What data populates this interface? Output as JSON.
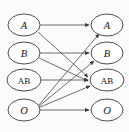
{
  "figure": {
    "background_color": "#fbfbfb",
    "stroke_color": "#3a3a3a",
    "edge_color": "#4a4a4a",
    "label_color": "#141414",
    "width": 129,
    "height": 132
  },
  "left_column": {
    "name": "source-nodes",
    "nodes": [
      {
        "id": "L_A",
        "label": "A",
        "style": "italic",
        "cx": 24,
        "cy": 25,
        "rx": 16,
        "ry": 11
      },
      {
        "id": "L_B",
        "label": "B",
        "style": "italic",
        "cx": 24,
        "cy": 53,
        "rx": 16,
        "ry": 11
      },
      {
        "id": "L_AB",
        "label": "AB",
        "style": "upright",
        "cx": 24,
        "cy": 80,
        "rx": 17,
        "ry": 11
      },
      {
        "id": "L_O",
        "label": "O",
        "style": "italic",
        "cx": 24,
        "cy": 110,
        "rx": 16,
        "ry": 11
      }
    ]
  },
  "right_column": {
    "name": "target-nodes",
    "nodes": [
      {
        "id": "R_A",
        "label": "A",
        "style": "italic",
        "cx": 107,
        "cy": 25,
        "rx": 16,
        "ry": 11
      },
      {
        "id": "R_B",
        "label": "B",
        "style": "italic",
        "cx": 107,
        "cy": 53,
        "rx": 16,
        "ry": 11
      },
      {
        "id": "R_AB",
        "label": "AB",
        "style": "upright",
        "cx": 107,
        "cy": 80,
        "rx": 17,
        "ry": 11
      },
      {
        "id": "R_O",
        "label": "O",
        "style": "italic",
        "cx": 107,
        "cy": 110,
        "rx": 16,
        "ry": 11
      }
    ]
  },
  "edges": [
    {
      "id": "e-A-A",
      "from": "L_A",
      "to": "R_A",
      "from_label": "A",
      "to_label": "A",
      "x1": 40,
      "y1": 25,
      "x2": 89,
      "y2": 25
    },
    {
      "id": "e-A-AB",
      "from": "L_A",
      "to": "R_AB",
      "from_label": "A",
      "to_label": "AB",
      "x1": 38,
      "y1": 32,
      "x2": 88,
      "y2": 77
    },
    {
      "id": "e-B-B",
      "from": "L_B",
      "to": "R_B",
      "from_label": "B",
      "to_label": "B",
      "x1": 40,
      "y1": 53,
      "x2": 89,
      "y2": 53
    },
    {
      "id": "e-B-AB",
      "from": "L_B",
      "to": "R_AB",
      "from_label": "B",
      "to_label": "AB",
      "x1": 39,
      "y1": 58,
      "x2": 88,
      "y2": 81
    },
    {
      "id": "e-AB-AB",
      "from": "L_AB",
      "to": "R_AB",
      "from_label": "AB",
      "to_label": "AB",
      "x1": 41,
      "y1": 80,
      "x2": 88,
      "y2": 80
    },
    {
      "id": "e-O-A",
      "from": "L_O",
      "to": "R_A",
      "from_label": "O",
      "to_label": "A",
      "x1": 38,
      "y1": 106,
      "x2": 99,
      "y2": 34
    },
    {
      "id": "e-O-B",
      "from": "L_O",
      "to": "R_B",
      "from_label": "O",
      "to_label": "B",
      "x1": 38,
      "y1": 107,
      "x2": 94,
      "y2": 61
    },
    {
      "id": "e-O-AB",
      "from": "L_O",
      "to": "R_AB",
      "from_label": "O",
      "to_label": "AB",
      "x1": 38,
      "y1": 108,
      "x2": 90,
      "y2": 86
    },
    {
      "id": "e-O-O",
      "from": "L_O",
      "to": "R_O",
      "from_label": "O",
      "to_label": "O",
      "x1": 40,
      "y1": 110,
      "x2": 89,
      "y2": 110
    }
  ]
}
